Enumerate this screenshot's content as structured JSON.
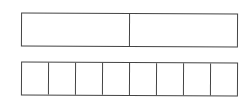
{
  "diagram": {
    "type": "fraction-bars",
    "stroke_color": "#444444",
    "background": "#ffffff",
    "bars": [
      {
        "name": "halves-bar",
        "parts": 2
      },
      {
        "name": "eighths-bar",
        "parts": 8
      }
    ]
  }
}
